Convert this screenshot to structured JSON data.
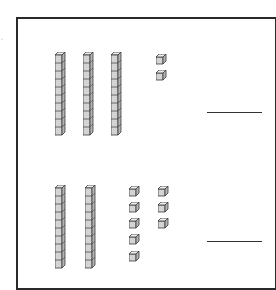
{
  "problem": {
    "label": ".",
    "colors": {
      "cube_face": "#d4d4d4",
      "cube_top": "#ececec",
      "cube_side": "#b4b4b4",
      "stroke": "#3a3a3a",
      "frame": "#2a2a2a"
    },
    "sections": [
      {
        "name": "top",
        "tens_rods": 3,
        "ones_cubes": 2,
        "answer_blank": ""
      },
      {
        "name": "bottom",
        "tens_rods": 2,
        "ones_cubes": 8,
        "answer_blank": ""
      }
    ]
  }
}
